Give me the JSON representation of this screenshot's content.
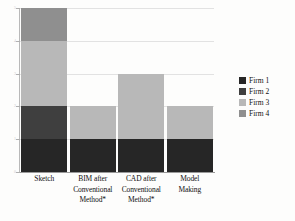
{
  "chart_data": {
    "type": "bar",
    "subtype": "stacked-vertical",
    "title": "",
    "xlabel": "",
    "ylabel": "",
    "ylim": [
      0,
      5
    ],
    "yticks": [
      0,
      1,
      2,
      3,
      4,
      5
    ],
    "ytick_labels": [
      "0",
      "1",
      "2",
      "3",
      "4",
      "5"
    ],
    "grid": true,
    "grid_axis": "y",
    "legend_position": "right",
    "categories": [
      "Sketch",
      "BIM after Conventional Method*",
      "CAD after Conventional Method*",
      "Model Making"
    ],
    "category_label_lines": [
      [
        "Sketch"
      ],
      [
        "BIM  after",
        "Conventional",
        "Method*"
      ],
      [
        "CAD after",
        "Conventional",
        "Method*"
      ],
      [
        "Model",
        "Making"
      ]
    ],
    "series": [
      {
        "name": "Firm 1",
        "color": "#262626",
        "values": [
          1,
          1,
          1,
          1
        ]
      },
      {
        "name": "Firm 2",
        "color": "#3f3f3f",
        "values": [
          1,
          0,
          0,
          0
        ]
      },
      {
        "name": "Firm 3",
        "color": "#b8b8b8",
        "values": [
          2,
          1,
          2,
          1
        ]
      },
      {
        "name": "Firm 4",
        "color": "#8f8f8f",
        "values": [
          1,
          0,
          0,
          0
        ]
      }
    ],
    "totals": [
      5,
      2,
      3,
      2
    ],
    "colors": {
      "firm1": "#262626",
      "firm2": "#3f3f3f",
      "firm3": "#b8b8b8",
      "firm4": "#8f8f8f",
      "gridline": "#e2e2e2",
      "axis": "#9a9a9a",
      "background": "#fdfdfc",
      "text": "#111111"
    }
  },
  "legend": {
    "items": [
      {
        "label": "Firm 1"
      },
      {
        "label": "Firm 2"
      },
      {
        "label": "Firm 3"
      },
      {
        "label": "Firm 4"
      }
    ]
  }
}
